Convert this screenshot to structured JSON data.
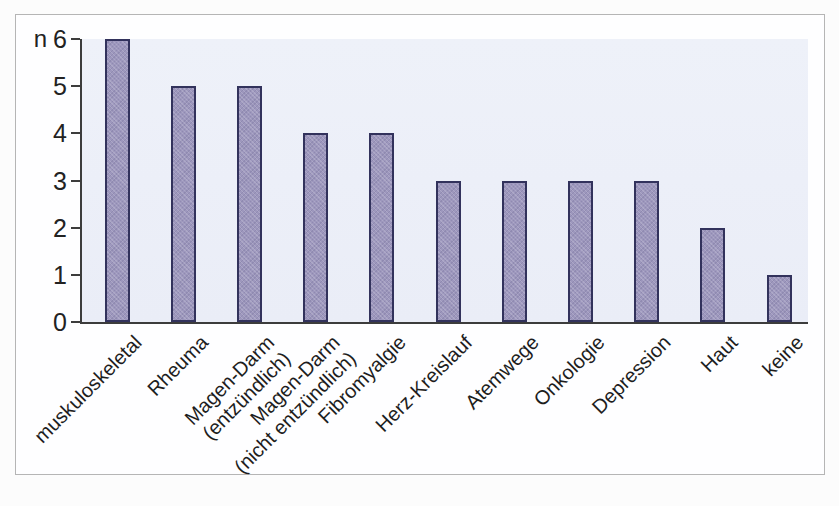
{
  "chart_data": {
    "type": "bar",
    "title": "",
    "xlabel": "",
    "ylabel": "n",
    "categories": [
      "muskuloskeletal",
      "Rheuma",
      "Magen-Darm\n(entzündlich)",
      "Magen-Darm\n(nicht entzündlich)",
      "Fibromyalgie",
      "Herz-Kreislauf",
      "Atemwege",
      "Onkologie",
      "Depression",
      "Haut",
      "keine"
    ],
    "values": [
      6,
      5,
      5,
      4,
      4,
      3,
      3,
      3,
      3,
      2,
      1
    ],
    "yticks": [
      0,
      1,
      2,
      3,
      4,
      5,
      6
    ],
    "ylim": [
      0,
      6
    ],
    "grid": false,
    "legend": "none",
    "colors": {
      "bar_fill": "#9d97bd",
      "bar_border": "#32325c",
      "plot_background": "#edf0f8",
      "axis": "#3c3c3c",
      "text": "#222222",
      "panel_border": "#b5b5b5"
    }
  }
}
